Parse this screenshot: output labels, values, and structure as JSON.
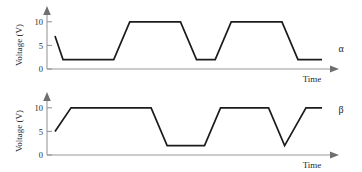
{
  "chart_data": [
    {
      "type": "line",
      "name": "alpha-waveform",
      "series_label": "α",
      "title": "",
      "xlabel": "Time",
      "ylabel": "Voltage (V)",
      "yticks": [
        0,
        5,
        10
      ],
      "yticklabels": [
        "0",
        "5",
        "10"
      ],
      "ylim": [
        0,
        11.5
      ],
      "xlim": [
        0,
        100
      ],
      "grid": false,
      "legend": "none",
      "high_level": 10,
      "low_level": 2,
      "start_level": 7,
      "x": [
        0,
        3,
        22,
        28,
        47,
        53,
        60,
        66,
        85,
        91,
        100
      ],
      "y": [
        7,
        2,
        2,
        10,
        10,
        2,
        2,
        10,
        10,
        2,
        2
      ]
    },
    {
      "type": "line",
      "name": "beta-waveform",
      "series_label": "β",
      "title": "",
      "xlabel": "Time",
      "ylabel": "Voltage (V)",
      "yticks": [
        0,
        5,
        10
      ],
      "yticklabels": [
        "0",
        "5",
        "10"
      ],
      "ylim": [
        0,
        11.5
      ],
      "xlim": [
        0,
        100
      ],
      "grid": false,
      "legend": "none",
      "high_level": 10,
      "low_level": 2,
      "start_level": 5,
      "x": [
        0,
        6,
        36,
        42,
        56,
        62,
        80,
        86,
        94,
        100
      ],
      "y": [
        5,
        10,
        10,
        2,
        2,
        10,
        10,
        2,
        10,
        10
      ]
    }
  ],
  "alpha": {
    "ylabel": "Voltage (V)",
    "xlabel": "Time",
    "series_label": "α",
    "tick_10": "10",
    "tick_5": "5",
    "tick_0": "0"
  },
  "beta": {
    "ylabel": "Voltage (V)",
    "xlabel": "Time",
    "series_label": "β",
    "tick_10": "10",
    "tick_5": "5",
    "tick_0": "0"
  },
  "colors": {
    "trace": "#1c1c1c",
    "axis": "#9a9a9a",
    "text": "#2a2a2a",
    "background": "#ffffff"
  }
}
